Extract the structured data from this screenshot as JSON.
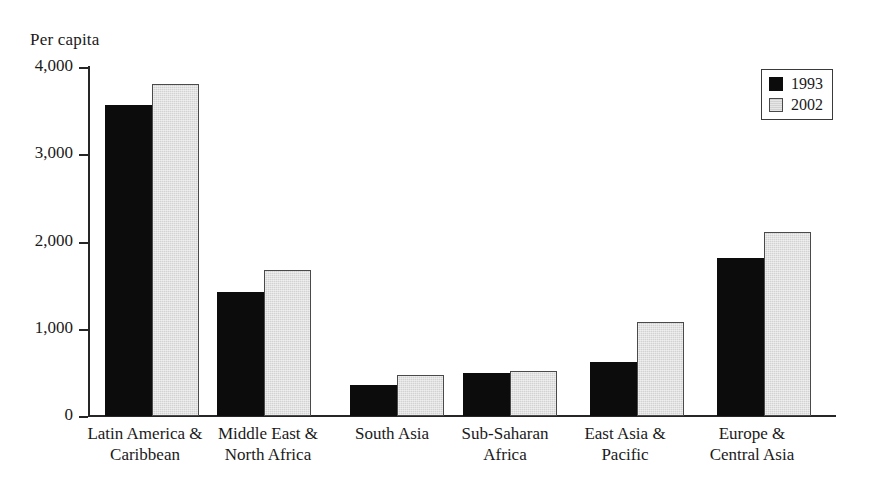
{
  "chart_data": {
    "type": "bar",
    "title": "",
    "subtitle": "",
    "ylabel": "Per capita",
    "xlabel": "",
    "ylim": [
      0,
      4000
    ],
    "yticks": [
      "0",
      "1,000",
      "2,000",
      "3,000",
      "4,000"
    ],
    "ytick_values": [
      0,
      1000,
      2000,
      3000,
      4000
    ],
    "grid": false,
    "legend_position": "top-right",
    "categories": [
      "Latin America & Caribbean",
      "Middle East & North Africa",
      "South Asia",
      "Sub-Saharan Africa",
      "East Asia & Pacific",
      "Europe & Central Asia"
    ],
    "category_lines": [
      [
        "Latin America &",
        "Caribbean"
      ],
      [
        "Middle East &",
        "North Africa"
      ],
      [
        "South Asia",
        ""
      ],
      [
        "Sub-Saharan",
        "Africa"
      ],
      [
        "East Asia &",
        "Pacific"
      ],
      [
        "Europe &",
        "Central Asia"
      ]
    ],
    "series": [
      {
        "name": "1993",
        "color": "#0c0c0c",
        "values": [
          3570,
          1420,
          350,
          490,
          620,
          1810
        ]
      },
      {
        "name": "2002",
        "color": "#d2d2d2",
        "values": [
          3800,
          1670,
          470,
          520,
          1080,
          2110
        ]
      }
    ]
  },
  "legend": {
    "items": [
      {
        "label": "1993",
        "swatch": "black-filled-square"
      },
      {
        "label": "2002",
        "swatch": "light-gray-filled-square"
      }
    ]
  }
}
